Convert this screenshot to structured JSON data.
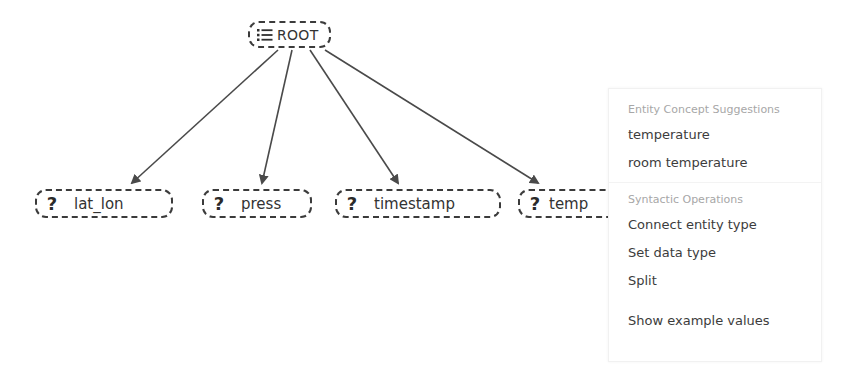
{
  "graph": {
    "root": {
      "label": "ROOT",
      "icon": "list-icon"
    },
    "nodes": [
      {
        "label": "lat_lon",
        "icon": "question-mark-icon",
        "icon_glyph": "?"
      },
      {
        "label": "press",
        "icon": "question-mark-icon",
        "icon_glyph": "?"
      },
      {
        "label": "timestamp",
        "icon": "question-mark-icon",
        "icon_glyph": "?"
      },
      {
        "label": "temp",
        "icon": "question-mark-icon",
        "icon_glyph": "?"
      }
    ],
    "edge_color": "#4a4a4a",
    "border_color": "#3b3b3b"
  },
  "context_menu": {
    "sections": [
      {
        "header": "Entity Concept Suggestions",
        "items": [
          "temperature",
          "room temperature"
        ]
      },
      {
        "header": "Syntactic Operations",
        "items": [
          "Connect entity type",
          "Set data type",
          "Split"
        ]
      }
    ],
    "footer_item": "Show example values"
  }
}
